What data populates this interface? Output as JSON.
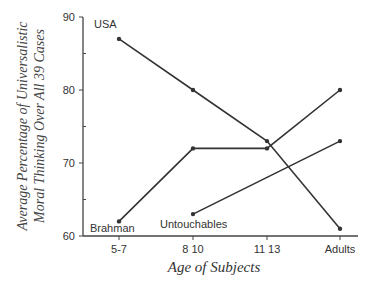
{
  "chart_data": {
    "type": "line",
    "title": "",
    "xlabel": "Age of Subjects",
    "ylabel_lines": [
      "Average Percentage of Universalistic",
      "Moral Thinking Over All 39 Cases"
    ],
    "categories": [
      "5-7",
      "8 10",
      "11 13",
      "Adults"
    ],
    "yticks": [
      60,
      70,
      80,
      90
    ],
    "ylim": [
      60,
      90
    ],
    "grid": false,
    "legend": "inline labels",
    "series": [
      {
        "name": "USA",
        "values": [
          87,
          80,
          73,
          61
        ]
      },
      {
        "name": "Brahman",
        "values": [
          62,
          72,
          72,
          80
        ]
      },
      {
        "name": "Untouchables",
        "values": [
          null,
          63,
          null,
          73
        ]
      }
    ],
    "colors": {
      "line": "#333333",
      "axis": "#444444",
      "text": "#333333"
    }
  }
}
